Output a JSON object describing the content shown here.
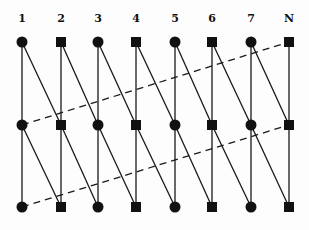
{
  "diagram": {
    "type": "lattice-graph",
    "columns": [
      {
        "label": "1",
        "shape": "circle",
        "x": 22
      },
      {
        "label": "2",
        "shape": "square",
        "x": 61
      },
      {
        "label": "3",
        "shape": "circle",
        "x": 98
      },
      {
        "label": "4",
        "shape": "square",
        "x": 136
      },
      {
        "label": "5",
        "shape": "circle",
        "x": 175
      },
      {
        "label": "6",
        "shape": "square",
        "x": 212
      },
      {
        "label": "7",
        "shape": "circle",
        "x": 251
      },
      {
        "label": "N",
        "shape": "square",
        "x": 289
      }
    ],
    "rows_y": [
      42,
      125,
      207
    ],
    "label_y": 22,
    "node_color": "#111111",
    "line_color": "#1a1a1a",
    "edges": {
      "vertical": "each column: row0-row1, row1-row2 (solid)",
      "diagonal": "column i row r to column i+1 row r+1 (solid), for r in 0..1",
      "wraparound_dashed": [
        {
          "from": {
            "col": "1",
            "row": 1
          },
          "to": {
            "col": "N",
            "row": 0
          }
        },
        {
          "from": {
            "col": "1",
            "row": 2
          },
          "to": {
            "col": "N",
            "row": 1
          }
        }
      ]
    }
  }
}
